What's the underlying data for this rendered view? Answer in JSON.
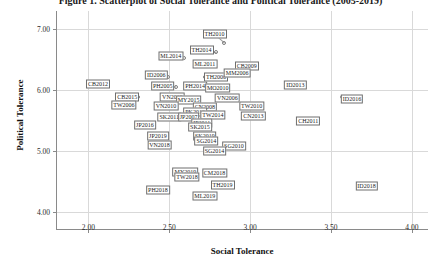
{
  "chart_data": {
    "type": "scatter",
    "title": "Figure 1. Scatterplot of Social Tolerance and Political Tolerance (2005-2019)",
    "xlabel": "Social Tolerance",
    "ylabel": "Political Tolerance",
    "xlim": [
      1.8,
      4.1
    ],
    "ylim": [
      3.7,
      7.3
    ],
    "xticks": [
      "2.00",
      "2.50",
      "3.00",
      "3.50",
      "4.00"
    ],
    "xtick_values": [
      2.0,
      2.5,
      3.0,
      3.5,
      4.0
    ],
    "yticks": [
      "4.00",
      "5.00",
      "6.00",
      "7.00"
    ],
    "ytick_values": [
      4.0,
      5.0,
      6.0,
      7.0
    ],
    "grid": true,
    "legend": "none",
    "marker_style": "open-circle",
    "points": [
      {
        "label": "TH2010",
        "x": 2.84,
        "y": 6.78,
        "lx": 2.78,
        "ly": 6.92
      },
      {
        "label": "TH2014",
        "x": 2.79,
        "y": 6.62,
        "lx": 2.7,
        "ly": 6.66
      },
      {
        "label": "ML2014",
        "x": 2.59,
        "y": 6.52,
        "lx": 2.51,
        "ly": 6.56
      },
      {
        "label": "ML2011",
        "x": 2.66,
        "y": 6.41,
        "lx": 2.72,
        "ly": 6.43
      },
      {
        "label": "CB2009",
        "x": 2.92,
        "y": 6.38,
        "lx": 2.98,
        "ly": 6.4
      },
      {
        "label": "ID2006",
        "x": 2.49,
        "y": 6.22,
        "lx": 2.42,
        "ly": 6.24
      },
      {
        "label": "TH2006",
        "x": 2.72,
        "y": 6.21,
        "lx": 2.79,
        "ly": 6.22
      },
      {
        "label": "CB2012",
        "x": 2.12,
        "y": 6.09,
        "lx": 2.06,
        "ly": 6.1
      },
      {
        "label": "PH2005",
        "x": 2.54,
        "y": 6.05,
        "lx": 2.46,
        "ly": 6.06
      },
      {
        "label": "PH2014",
        "x": 2.66,
        "y": 6.05,
        "lx": 2.66,
        "ly": 6.06
      },
      {
        "label": "MO2010",
        "x": 2.8,
        "y": 6.02,
        "lx": 2.8,
        "ly": 6.04
      },
      {
        "label": "MM2006",
        "x": 2.92,
        "y": 6.26,
        "lx": 2.92,
        "ly": 6.28
      },
      {
        "label": "ID2013",
        "x": 3.27,
        "y": 6.07,
        "lx": 3.28,
        "ly": 6.08
      },
      {
        "label": "CB2015",
        "x": 2.31,
        "y": 5.88,
        "lx": 2.24,
        "ly": 5.88
      },
      {
        "label": "VN2015",
        "x": 2.58,
        "y": 5.88,
        "lx": 2.52,
        "ly": 5.88
      },
      {
        "label": "MY2015",
        "x": 2.62,
        "y": 5.83,
        "lx": 2.62,
        "ly": 5.83
      },
      {
        "label": "VN2006",
        "x": 2.86,
        "y": 5.86,
        "lx": 2.86,
        "ly": 5.87
      },
      {
        "label": "TW2006",
        "x": 2.26,
        "y": 5.76,
        "lx": 2.22,
        "ly": 5.76
      },
      {
        "label": "VN2010",
        "x": 2.52,
        "y": 5.73,
        "lx": 2.48,
        "ly": 5.74
      },
      {
        "label": "CN2008",
        "x": 2.72,
        "y": 5.72,
        "lx": 2.72,
        "ly": 5.73
      },
      {
        "label": "ID2016",
        "x": 3.57,
        "y": 5.88,
        "lx": 3.63,
        "ly": 5.85
      },
      {
        "label": "TW2010",
        "x": 2.96,
        "y": 5.74,
        "lx": 3.01,
        "ly": 5.74
      },
      {
        "label": "PK2010",
        "x": 2.66,
        "y": 5.63,
        "lx": 2.66,
        "ly": 5.64
      },
      {
        "label": "TW2014",
        "x": 2.76,
        "y": 5.58,
        "lx": 2.77,
        "ly": 5.59
      },
      {
        "label": "CN2013",
        "x": 2.99,
        "y": 5.57,
        "lx": 3.02,
        "ly": 5.57
      },
      {
        "label": "SK2011",
        "x": 2.54,
        "y": 5.54,
        "lx": 2.5,
        "ly": 5.55
      },
      {
        "label": "JP2007",
        "x": 2.62,
        "y": 5.54,
        "lx": 2.62,
        "ly": 5.55
      },
      {
        "label": "JP2011",
        "x": 2.7,
        "y": 5.46,
        "lx": 2.7,
        "ly": 5.46
      },
      {
        "label": "CH2011",
        "x": 3.33,
        "y": 5.5,
        "lx": 3.36,
        "ly": 5.5
      },
      {
        "label": "JP2016",
        "x": 2.39,
        "y": 5.42,
        "lx": 2.35,
        "ly": 5.42
      },
      {
        "label": "SK2015",
        "x": 2.66,
        "y": 5.39,
        "lx": 2.69,
        "ly": 5.39
      },
      {
        "label": "JP2019",
        "x": 2.46,
        "y": 5.25,
        "lx": 2.43,
        "ly": 5.25
      },
      {
        "label": "SK2019",
        "x": 2.69,
        "y": 5.24,
        "lx": 2.72,
        "ly": 5.24
      },
      {
        "label": "SG2014",
        "x": 2.72,
        "y": 5.16,
        "lx": 2.73,
        "ly": 5.16
      },
      {
        "label": "VN2018",
        "x": 2.47,
        "y": 5.1,
        "lx": 2.44,
        "ly": 5.1
      },
      {
        "label": "SG2010",
        "x": 2.86,
        "y": 5.08,
        "lx": 2.9,
        "ly": 5.08
      },
      {
        "label": "SG2014b",
        "x": 2.78,
        "y": 5.0,
        "lx": 2.78,
        "ly": 5.0
      },
      {
        "label": "MY2019",
        "x": 2.63,
        "y": 4.66,
        "lx": 2.6,
        "ly": 4.66
      },
      {
        "label": "CM2018",
        "x": 2.76,
        "y": 4.64,
        "lx": 2.78,
        "ly": 4.64
      },
      {
        "label": "TW2018",
        "x": 2.64,
        "y": 4.57,
        "lx": 2.61,
        "ly": 4.57
      },
      {
        "label": "TH2019",
        "x": 2.8,
        "y": 4.44,
        "lx": 2.83,
        "ly": 4.44
      },
      {
        "label": "ML2019",
        "x": 2.74,
        "y": 4.3,
        "lx": 2.72,
        "ly": 4.26
      },
      {
        "label": "PH2018",
        "x": 2.46,
        "y": 4.38,
        "lx": 2.43,
        "ly": 4.36
      },
      {
        "label": "ID2018",
        "x": 3.68,
        "y": 4.44,
        "lx": 3.72,
        "ly": 4.42
      }
    ]
  }
}
